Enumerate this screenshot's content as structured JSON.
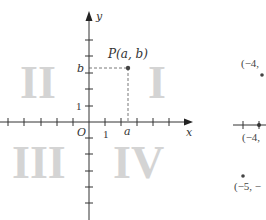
{
  "figure": {
    "axes": {
      "x_label": "x",
      "y_label": "y",
      "origin_label": "O",
      "x_unit_label": "1",
      "y_unit_label": "1",
      "x_point_label": "a",
      "y_point_label": "b"
    },
    "point": {
      "label": "P(a, b)",
      "a": 2.4,
      "b": 3.4
    },
    "quadrants": [
      {
        "label": "I"
      },
      {
        "label": "II"
      },
      {
        "label": "III"
      },
      {
        "label": "IV"
      }
    ],
    "side_panel": {
      "labels": [
        {
          "text": "(−4,"
        },
        {
          "text": "(−4,"
        },
        {
          "text": "(−5, −"
        }
      ]
    },
    "colors": {
      "axis": "#333333",
      "quadrant_numeral": "#d4d4d4",
      "point": "#444444",
      "dashed": "#555555"
    }
  }
}
